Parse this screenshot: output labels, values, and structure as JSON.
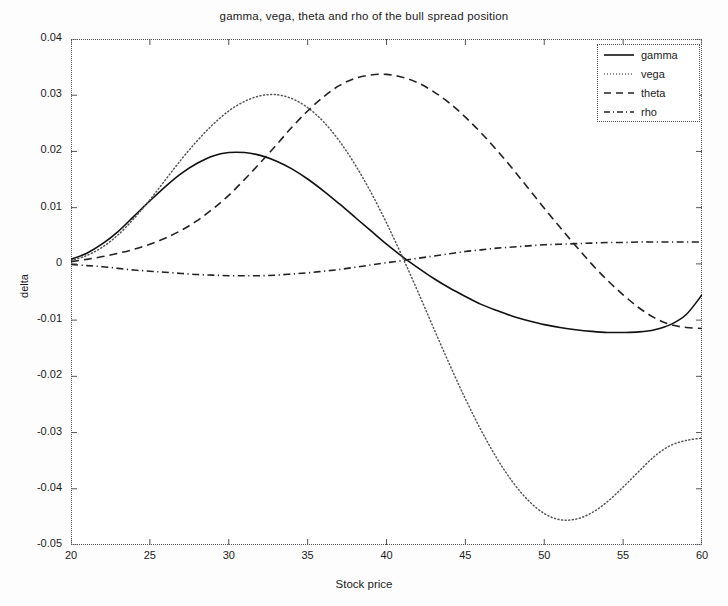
{
  "chart_data": {
    "type": "line",
    "title": "gamma, vega, theta and rho of the bull spread position",
    "xlabel": "Stock price",
    "ylabel": "delta",
    "xlim": [
      20,
      60
    ],
    "ylim": [
      -0.05,
      0.04
    ],
    "xticks": [
      20,
      25,
      30,
      35,
      40,
      45,
      50,
      55,
      60
    ],
    "xtick_labels": [
      "20",
      "25",
      "30",
      "35",
      "40",
      "45",
      "50",
      "55",
      "60"
    ],
    "yticks": [
      0.04,
      0.03,
      0.02,
      0.01,
      0,
      -0.01,
      -0.02,
      -0.03,
      -0.04,
      -0.05
    ],
    "ytick_labels": [
      "0.04",
      "0.03",
      "0.02",
      "0.01",
      "0",
      "-0.01",
      "-0.02",
      "-0.03",
      "-0.04",
      "-0.05"
    ],
    "grid": false,
    "legend_position": "upper right",
    "x": [
      20,
      21,
      22,
      23,
      24,
      25,
      26,
      27,
      28,
      29,
      30,
      31,
      32,
      33,
      34,
      35,
      36,
      37,
      38,
      39,
      40,
      41,
      42,
      43,
      44,
      45,
      46,
      47,
      48,
      49,
      50,
      51,
      52,
      53,
      54,
      55,
      56,
      57,
      58,
      59,
      60
    ],
    "series": [
      {
        "name": "gamma",
        "style": "solid",
        "color": "#111111",
        "values": [
          0.0008,
          0.0019,
          0.0036,
          0.0058,
          0.0085,
          0.0112,
          0.0138,
          0.0161,
          0.0179,
          0.0192,
          0.0198,
          0.0198,
          0.0193,
          0.0183,
          0.0169,
          0.0151,
          0.013,
          0.0107,
          0.0083,
          0.0059,
          0.0035,
          0.0013,
          -0.0007,
          -0.0026,
          -0.0043,
          -0.0058,
          -0.0072,
          -0.0083,
          -0.0093,
          -0.0101,
          -0.0108,
          -0.0113,
          -0.0117,
          -0.012,
          -0.0122,
          -0.0122,
          -0.0121,
          -0.0117,
          -0.0108,
          -0.009,
          -0.0055
        ]
      },
      {
        "name": "vega",
        "style": "dotted",
        "color": "#555555",
        "values": [
          0.0006,
          0.0015,
          0.003,
          0.0052,
          0.0081,
          0.0114,
          0.015,
          0.0186,
          0.0219,
          0.0248,
          0.0272,
          0.0289,
          0.0299,
          0.0301,
          0.0294,
          0.0278,
          0.0253,
          0.0219,
          0.0177,
          0.0128,
          0.0073,
          0.0013,
          -0.005,
          -0.0115,
          -0.0179,
          -0.024,
          -0.0296,
          -0.0346,
          -0.0388,
          -0.0421,
          -0.0444,
          -0.0455,
          -0.0454,
          -0.0443,
          -0.0423,
          -0.0397,
          -0.0369,
          -0.0342,
          -0.0323,
          -0.0314,
          -0.031
        ]
      },
      {
        "name": "theta",
        "style": "dashed",
        "color": "#222222",
        "values": [
          0.0004,
          0.0008,
          0.0013,
          0.0019,
          0.0026,
          0.0035,
          0.0046,
          0.006,
          0.0077,
          0.0098,
          0.0122,
          0.015,
          0.018,
          0.0211,
          0.0243,
          0.0272,
          0.0297,
          0.0317,
          0.033,
          0.0336,
          0.0337,
          0.0332,
          0.0322,
          0.0306,
          0.0286,
          0.0261,
          0.0233,
          0.0202,
          0.0169,
          0.0134,
          0.0099,
          0.0065,
          0.0032,
          0.0,
          -0.0029,
          -0.0055,
          -0.0078,
          -0.0096,
          -0.0108,
          -0.0113,
          -0.0115
        ]
      },
      {
        "name": "rho",
        "style": "dashdot",
        "color": "#222222",
        "values": [
          -0.0001,
          -0.0003,
          -0.0005,
          -0.0008,
          -0.0011,
          -0.0013,
          -0.0015,
          -0.0017,
          -0.0019,
          -0.002,
          -0.0021,
          -0.0021,
          -0.0021,
          -0.002,
          -0.0018,
          -0.0016,
          -0.0013,
          -0.001,
          -0.0006,
          -0.0002,
          0.0002,
          0.0006,
          0.001,
          0.0014,
          0.0018,
          0.0022,
          0.0025,
          0.0028,
          0.003,
          0.0032,
          0.0034,
          0.0035,
          0.0036,
          0.0037,
          0.0038,
          0.0038,
          0.0039,
          0.0039,
          0.0039,
          0.0039,
          0.0039
        ]
      }
    ]
  },
  "legend": {
    "items": [
      {
        "label": "gamma",
        "style": "solid"
      },
      {
        "label": "vega",
        "style": "dotted"
      },
      {
        "label": "theta",
        "style": "dashed"
      },
      {
        "label": "rho",
        "style": "dashdot"
      }
    ]
  }
}
